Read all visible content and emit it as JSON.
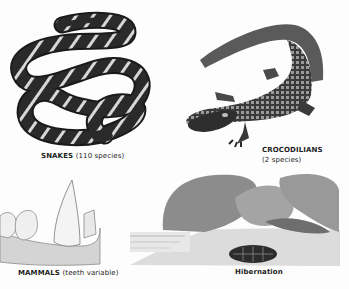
{
  "page": {
    "background": "#fdfdfd"
  },
  "illustrations": {
    "snake": {
      "icon": "snake-illustration",
      "caption_main": "SNAKES",
      "caption_detail": "(110 species)",
      "colors": {
        "dark": "#2a2a2a",
        "band": "#d8d8d8"
      }
    },
    "crocodilian": {
      "icon": "alligator-illustration",
      "caption_line1": "CROCODILIANS",
      "caption_line2": "(2 species)",
      "colors": {
        "dark": "#3a3a3a",
        "scales": "#9a9a9a"
      }
    },
    "mammal_teeth": {
      "icon": "teeth-illustration",
      "caption_main": "MAMMALS",
      "caption_detail": "(teeth variable)",
      "colors": {
        "tooth": "#f2f2f2",
        "gum": "#d4d4d4"
      }
    },
    "hibernation": {
      "icon": "turtle-hibernation-illustration",
      "caption": "Hibernation",
      "colors": {
        "rock": "#8c8c8c",
        "ground": "#dcdcdc",
        "shell": "#2c2c2c"
      }
    }
  }
}
